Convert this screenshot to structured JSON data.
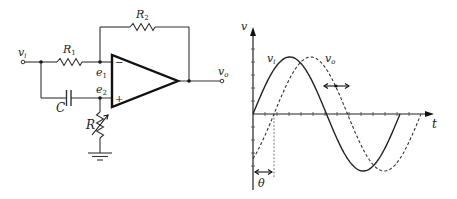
{
  "circuit": {
    "labels": {
      "input": "v",
      "input_sub": "i",
      "output": "v",
      "output_sub": "o",
      "r1": "R",
      "r1_sub": "1",
      "r2": "R",
      "r2_sub": "2",
      "capacitor": "C",
      "variable_resistor": "R",
      "node1": "e",
      "node1_sub": "1",
      "node2": "e",
      "node2_sub": "2",
      "inverting": "−",
      "noninverting": "+"
    }
  },
  "waveform": {
    "y_axis_label": "v",
    "x_axis_label": "t",
    "input_label": "v",
    "input_label_sub": "i",
    "output_label": "v",
    "output_label_sub": "o",
    "phase_label": "θ"
  },
  "chart_data": {
    "type": "line",
    "title": "",
    "xlabel": "t",
    "ylabel": "v",
    "series": [
      {
        "name": "v_i",
        "style": "solid",
        "function": "sin(t)",
        "phase_deg": 0,
        "amplitude": 1,
        "x_range_deg": [
          0,
          360
        ]
      },
      {
        "name": "v_o",
        "style": "dashed",
        "function": "sin(t - θ)",
        "phase_shift_deg": 60,
        "amplitude": 1,
        "x_range_deg": [
          0,
          420
        ]
      }
    ],
    "annotations": [
      {
        "text": "θ",
        "meaning": "phase lag between v_i and v_o"
      },
      {
        "text": "↔",
        "meaning": "double arrow indicating v_o shifts horizontally as R varies"
      }
    ],
    "grid": false,
    "ticks": "unlabeled minor ticks on both axes"
  }
}
